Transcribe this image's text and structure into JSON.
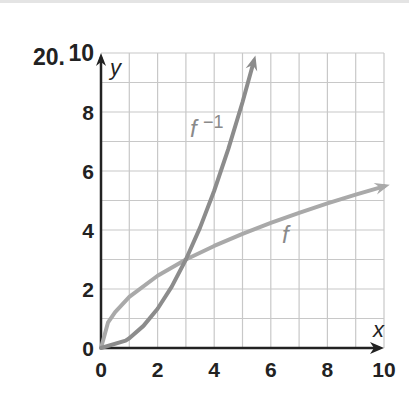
{
  "problem_number": "20.",
  "chart_data": {
    "type": "line",
    "title": "",
    "xlabel": "x",
    "ylabel": "y",
    "xlim": [
      0,
      10
    ],
    "ylim": [
      0,
      10
    ],
    "grid": true,
    "x_ticks": [
      "0",
      "2",
      "4",
      "6",
      "8",
      "10"
    ],
    "y_ticks": [
      "0",
      "2",
      "4",
      "6",
      "8",
      "10"
    ],
    "series": [
      {
        "name": "f",
        "label": "f",
        "color": "#a9a9a9",
        "points": [
          [
            0,
            0
          ],
          [
            0.25,
            0.87
          ],
          [
            0.5,
            1.22
          ],
          [
            1,
            1.73
          ],
          [
            2,
            2.45
          ],
          [
            3,
            3
          ],
          [
            4,
            3.46
          ],
          [
            5,
            3.87
          ],
          [
            6,
            4.24
          ],
          [
            7,
            4.58
          ],
          [
            8,
            4.9
          ],
          [
            9,
            5.2
          ],
          [
            10,
            5.48
          ]
        ]
      },
      {
        "name": "f^-1",
        "label": "f⁻¹",
        "color": "#8c8c8c",
        "points": [
          [
            0,
            0
          ],
          [
            0.87,
            0.25
          ],
          [
            1,
            0.33
          ],
          [
            1.5,
            0.75
          ],
          [
            2,
            1.33
          ],
          [
            2.5,
            2.08
          ],
          [
            3,
            3
          ],
          [
            3.5,
            4.08
          ],
          [
            4,
            5.33
          ],
          [
            4.5,
            6.75
          ],
          [
            5,
            8.33
          ],
          [
            5.4,
            9.72
          ]
        ]
      }
    ],
    "annotations": [
      "f⁻¹",
      "f"
    ]
  }
}
